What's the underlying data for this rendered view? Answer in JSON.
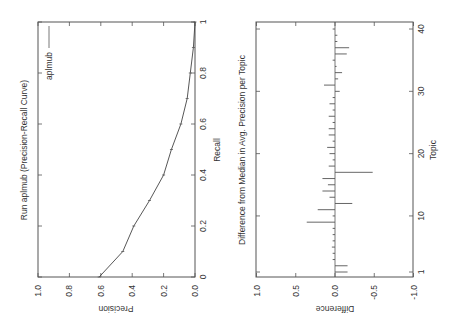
{
  "chart_data": [
    {
      "type": "line",
      "title": "Run aplmub (Precision-Recall Curve)",
      "xlabel": "Recall",
      "ylabel": "Precision",
      "xlim": [
        0,
        1
      ],
      "ylim": [
        0.0,
        1.0
      ],
      "x_ticks": [
        "0",
        "0.2",
        "0.4",
        "0.6",
        "0.8",
        "1"
      ],
      "y_ticks": [
        "0.0",
        "0.2",
        "0.4",
        "0.6",
        "0.8",
        "1.0"
      ],
      "grid": false,
      "legend": {
        "entries": [
          "aplmub"
        ],
        "position": "upper right"
      },
      "series": [
        {
          "name": "aplmub",
          "x": [
            0.0,
            0.1,
            0.2,
            0.3,
            0.4,
            0.5,
            0.6,
            0.7,
            0.8,
            0.9,
            1.0
          ],
          "values": [
            0.61,
            0.46,
            0.39,
            0.29,
            0.2,
            0.15,
            0.09,
            0.05,
            0.03,
            0.01,
            0.0
          ]
        }
      ],
      "orientation_note": "figure rendered rotated 90 degrees counter-clockwise"
    },
    {
      "type": "bar",
      "title": "Difference from Median in Avg. Precision per Topic",
      "xlabel": "Topic",
      "ylabel": "Difference",
      "xlim": [
        1,
        40
      ],
      "ylim": [
        -1.0,
        1.0
      ],
      "x_ticks": [
        "1",
        "10",
        "20",
        "30",
        "40"
      ],
      "y_ticks": [
        "1.0",
        "0.5",
        "0.0",
        "-0.5",
        "-1.0"
      ],
      "grid": false,
      "categories": [
        1,
        2,
        3,
        4,
        5,
        6,
        7,
        8,
        9,
        10,
        11,
        12,
        13,
        14,
        15,
        16,
        17,
        18,
        19,
        20,
        21,
        22,
        23,
        24,
        25,
        26,
        27,
        28,
        29,
        30,
        31,
        32,
        33,
        34,
        35,
        36,
        37,
        38,
        39,
        40
      ],
      "values": [
        -0.16,
        -0.16,
        0.01,
        0.01,
        0.04,
        0.01,
        0.01,
        0.03,
        0.36,
        0.01,
        0.22,
        -0.22,
        0.07,
        0.16,
        0.09,
        0.16,
        -0.48,
        0.08,
        0.01,
        0.07,
        0.1,
        0.01,
        0.08,
        0.08,
        0.01,
        0.08,
        0.01,
        0.07,
        0.01,
        -0.06,
        0.14,
        -0.04,
        -0.09,
        -0.02,
        0.01,
        -0.15,
        -0.18,
        -0.01,
        -0.01,
        0.01
      ],
      "orientation_note": "figure rendered rotated 90 degrees counter-clockwise"
    }
  ],
  "labels": {
    "pr_title": "Run aplmub (Precision-Recall Curve)",
    "pr_xlabel": "Recall",
    "pr_ylabel": "Precision",
    "pr_legend": "aplmub",
    "diff_title": "Difference from Median in Avg. Precision per Topic",
    "diff_xlabel": "Topic",
    "diff_ylabel": "Difference",
    "pr_recall_ticks": [
      "0",
      "0.2",
      "0.4",
      "0.6",
      "0.8",
      "1"
    ],
    "pr_precision_ticks": [
      "1.0",
      "0.8",
      "0.6",
      "0.4",
      "0.2",
      "0.0"
    ],
    "diff_topic_ticks": [
      "1",
      "10",
      "20",
      "30",
      "40"
    ],
    "diff_value_ticks": [
      "1.0",
      "0.5",
      "0.0",
      "-0.5",
      "-1.0"
    ]
  }
}
